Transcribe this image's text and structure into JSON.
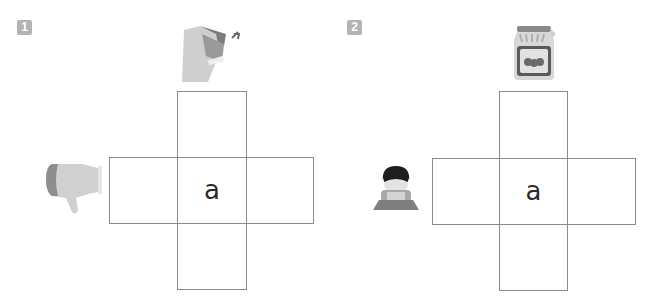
{
  "puzzles": [
    {
      "number": "1",
      "top_picture": "stapler-icon",
      "left_picture": "thumbs-down-icon",
      "center_letter": "a",
      "grid": {
        "cols_x": [
          109,
          177,
          246,
          313
        ],
        "rows_y": [
          91,
          157,
          223,
          289
        ]
      }
    },
    {
      "number": "2",
      "top_picture": "jam-jar-icon",
      "left_picture": "sad-boy-icon",
      "center_letter": "a",
      "grid": {
        "cols_x": [
          432,
          499,
          567,
          635
        ],
        "rows_y": [
          91,
          158,
          224,
          290
        ]
      }
    }
  ],
  "colors": {
    "badge": "#b4b4b4",
    "grid_line": "#8a8a8a",
    "picture_grey": "#c8c8c8",
    "picture_dark": "#7a7a7a"
  }
}
